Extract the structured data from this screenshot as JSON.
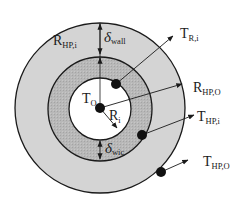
{
  "diagram": {
    "colors": {
      "background": "#ffffff",
      "outer_wall": "#d4d4d4",
      "wick": "#b4b4b4",
      "vapor_core": "#ffffff",
      "stroke": "#1a1a1a",
      "node": "#111111"
    },
    "circles": [
      {
        "name": "outer-wall",
        "cx": 100,
        "cy": 108,
        "r": 85
      },
      {
        "name": "wick-layer",
        "cx": 100,
        "cy": 109,
        "r": 52
      },
      {
        "name": "vapor-core",
        "cx": 100,
        "cy": 109,
        "r": 31
      }
    ],
    "labels": {
      "r_hp_i": {
        "main": "R",
        "sub": "HP,i"
      },
      "delta_wall": {
        "main": "δ",
        "sub": "wall"
      },
      "t_r_i": {
        "main": "T",
        "sub": "R,i"
      },
      "r_hp_o": {
        "main": "R",
        "sub": "HP,O"
      },
      "t_o": {
        "main": "T",
        "sub": "O"
      },
      "r_i": {
        "main": "R",
        "sub": "i"
      },
      "t_hp_i": {
        "main": "T",
        "sub": "HP,i"
      },
      "delta_wic": {
        "main": "δ",
        "sub": "wic"
      },
      "t_hp_o": {
        "main": "T",
        "sub": "HP,O"
      }
    },
    "nodes": [
      {
        "name": "node-t-o",
        "cx": 100,
        "cy": 108
      },
      {
        "name": "node-t-r-i",
        "cx": 116,
        "cy": 84
      },
      {
        "name": "node-t-hp-i",
        "cx": 142,
        "cy": 135
      },
      {
        "name": "node-t-hp-o",
        "cx": 161,
        "cy": 172
      }
    ]
  }
}
